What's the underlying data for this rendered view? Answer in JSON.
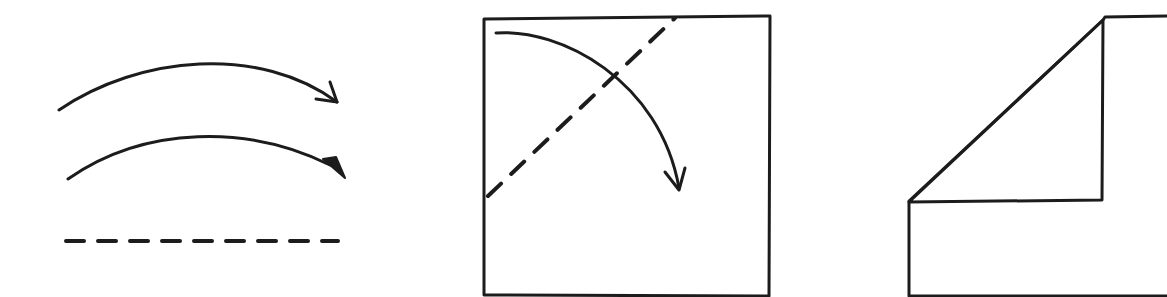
{
  "diagram": {
    "type": "origami-instructions",
    "background": "#ffffff",
    "ink_color": "#1c1c1c",
    "legend": {
      "symbols": [
        {
          "name": "valley-fold-arrow",
          "description": "curved arrow with open arrowhead"
        },
        {
          "name": "mountain-fold-arrow",
          "description": "curved arrow with filled triangular arrowhead"
        },
        {
          "name": "fold-line",
          "description": "dashed line"
        }
      ]
    },
    "steps": [
      {
        "name": "step-square-with-diagonal-fold",
        "description": "square with dashed diagonal fold line and curved arrow showing top-left corner folding down"
      },
      {
        "name": "step-folded-result",
        "description": "shape after corner folded, showing triangular flap"
      }
    ]
  }
}
